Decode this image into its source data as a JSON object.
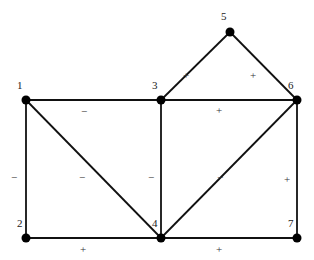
{
  "diagram": {
    "type": "signed-graph",
    "nodes": [
      {
        "id": "1",
        "label": "1",
        "x": 26,
        "y": 100,
        "lx": 17,
        "ly": 89
      },
      {
        "id": "2",
        "label": "2",
        "x": 26,
        "y": 238,
        "lx": 17,
        "ly": 227
      },
      {
        "id": "3",
        "label": "3",
        "x": 161,
        "y": 100,
        "lx": 152,
        "ly": 89
      },
      {
        "id": "4",
        "label": "4",
        "x": 161,
        "y": 238,
        "lx": 152,
        "ly": 227
      },
      {
        "id": "5",
        "label": "5",
        "x": 230,
        "y": 32,
        "lx": 221,
        "ly": 20
      },
      {
        "id": "6",
        "label": "6",
        "x": 297,
        "y": 100,
        "lx": 288,
        "ly": 89
      },
      {
        "id": "7",
        "label": "7",
        "x": 297,
        "y": 238,
        "lx": 288,
        "ly": 227
      }
    ],
    "edges": [
      {
        "from": "1",
        "to": "3",
        "sign": "−",
        "lx": 84,
        "ly": 112
      },
      {
        "from": "1",
        "to": "2",
        "sign": "−",
        "lx": 14,
        "ly": 178
      },
      {
        "from": "1",
        "to": "4",
        "sign": "−",
        "lx": 82,
        "ly": 178
      },
      {
        "from": "2",
        "to": "4",
        "sign": "+",
        "lx": 83,
        "ly": 250
      },
      {
        "from": "3",
        "to": "4",
        "sign": "−",
        "lx": 151,
        "ly": 178
      },
      {
        "from": "3",
        "to": "5",
        "sign": "+",
        "lx": 186,
        "ly": 76
      },
      {
        "from": "5",
        "to": "6",
        "sign": "+",
        "lx": 253,
        "ly": 76
      },
      {
        "from": "3",
        "to": "6",
        "sign": "+",
        "lx": 219,
        "ly": 111
      },
      {
        "from": "4",
        "to": "6",
        "sign": "−",
        "lx": 220,
        "ly": 178
      },
      {
        "from": "6",
        "to": "7",
        "sign": "+",
        "lx": 287,
        "ly": 180
      },
      {
        "from": "4",
        "to": "7",
        "sign": "+",
        "lx": 219,
        "ly": 250
      }
    ]
  }
}
